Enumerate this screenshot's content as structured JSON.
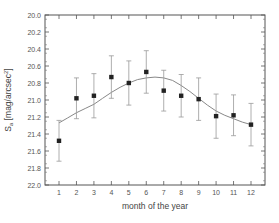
{
  "chart_data": {
    "type": "scatter",
    "title": "",
    "xlabel": "month of the year",
    "ylabel": "S_a [mag/arcsec^2]",
    "ylabel_main": "S",
    "ylabel_sub": "a",
    "ylabel_rest": " [mag/arcsec",
    "ylabel_sup": "2",
    "ylabel_end": "]",
    "xlim": [
      0.2,
      12.8
    ],
    "ylim": [
      22.0,
      20.0
    ],
    "y_inverted": true,
    "grid": false,
    "legend": null,
    "x_ticks": [
      "1",
      "2",
      "3",
      "4",
      "5",
      "6",
      "7",
      "8",
      "9",
      "10",
      "11",
      "12"
    ],
    "y_ticks": [
      "20.0",
      "20.2",
      "20.4",
      "20.6",
      "20.8",
      "21.0",
      "21.2",
      "21.4",
      "21.6",
      "21.8",
      "22.0"
    ],
    "series": [
      {
        "name": "monthly mean",
        "type": "scatter",
        "marker": "square",
        "color": "#222222",
        "x": [
          1,
          2,
          3,
          4,
          5,
          6,
          7,
          8,
          9,
          10,
          11,
          12
        ],
        "values": [
          21.48,
          20.98,
          20.95,
          20.73,
          20.8,
          20.67,
          20.89,
          20.95,
          20.99,
          21.19,
          21.18,
          21.29
        ],
        "error": [
          0.24,
          0.24,
          0.26,
          0.25,
          0.26,
          0.25,
          0.24,
          0.25,
          0.25,
          0.26,
          0.24,
          0.25
        ]
      },
      {
        "name": "fit",
        "type": "line",
        "color": "#888888",
        "x": [
          1,
          1.5,
          2,
          2.5,
          3,
          3.5,
          4,
          4.5,
          5,
          5.5,
          6,
          6.5,
          7,
          7.5,
          8,
          8.5,
          9,
          9.5,
          10,
          10.5,
          11,
          11.5,
          12
        ],
        "values": [
          21.27,
          21.21,
          21.15,
          21.1,
          21.05,
          20.98,
          20.91,
          20.85,
          20.8,
          20.76,
          20.74,
          20.73,
          20.74,
          20.77,
          20.83,
          20.9,
          20.98,
          21.06,
          21.13,
          21.18,
          21.22,
          21.26,
          21.29
        ]
      }
    ]
  }
}
